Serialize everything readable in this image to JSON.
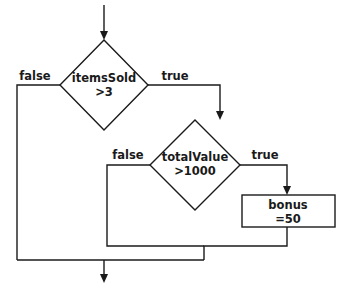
{
  "flowchart": {
    "nodes": {
      "decision1": {
        "line1": "itemsSold",
        "line2": ">3"
      },
      "decision2": {
        "line1": "totalValue",
        "line2": ">1000"
      },
      "process1": {
        "line1": "bonus",
        "line2": "=50"
      }
    },
    "edges": {
      "d1_false": "false",
      "d1_true": "true",
      "d2_false": "false",
      "d2_true": "true"
    }
  }
}
